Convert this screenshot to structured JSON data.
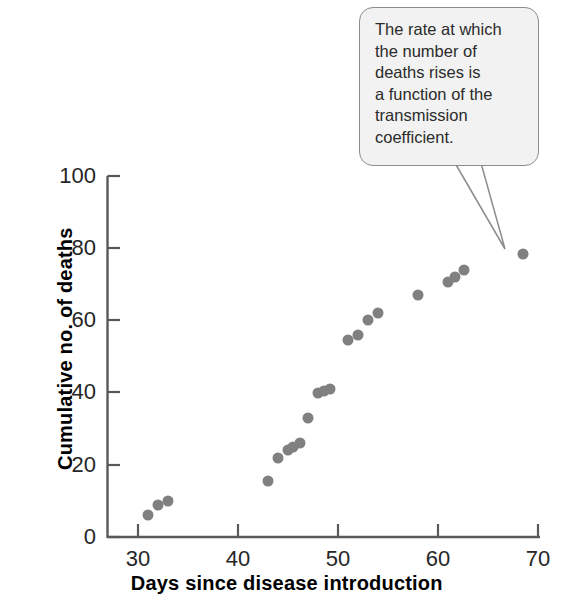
{
  "chart_data": {
    "type": "scatter",
    "title": "",
    "xlabel": "Days since disease introduction",
    "ylabel": "Cumulative no. of deaths",
    "xlim": [
      28,
      70
    ],
    "ylim": [
      0,
      100
    ],
    "xticks": [
      30,
      40,
      50,
      60,
      70
    ],
    "yticks": [
      0,
      20,
      40,
      60,
      80,
      100
    ],
    "grid": false,
    "legend": null,
    "marker_color": "#808080",
    "marker_size": 11,
    "x": [
      31,
      32,
      33,
      43,
      44,
      45,
      45.5,
      46.2,
      47,
      48,
      48.6,
      49.2,
      51,
      52,
      53,
      54,
      58,
      61,
      61.7,
      62.6,
      68.5
    ],
    "y": [
      6,
      9,
      10,
      15.5,
      22,
      24,
      25,
      26,
      33,
      40,
      40.5,
      41,
      54.5,
      56,
      60,
      62,
      67,
      70.5,
      72,
      74,
      78.5
    ],
    "series": [
      {
        "name": "Cumulative deaths",
        "points": [
          {
            "x": 31,
            "y": 6
          },
          {
            "x": 32,
            "y": 9
          },
          {
            "x": 33,
            "y": 10
          },
          {
            "x": 43,
            "y": 15.5
          },
          {
            "x": 44,
            "y": 22
          },
          {
            "x": 45,
            "y": 24
          },
          {
            "x": 45.5,
            "y": 25
          },
          {
            "x": 46.2,
            "y": 26
          },
          {
            "x": 47,
            "y": 33
          },
          {
            "x": 48,
            "y": 40
          },
          {
            "x": 48.6,
            "y": 40.5
          },
          {
            "x": 49.2,
            "y": 41
          },
          {
            "x": 51,
            "y": 54.5
          },
          {
            "x": 52,
            "y": 56
          },
          {
            "x": 53,
            "y": 60
          },
          {
            "x": 54,
            "y": 62
          },
          {
            "x": 58,
            "y": 67
          },
          {
            "x": 61,
            "y": 70.5
          },
          {
            "x": 61.7,
            "y": 72
          },
          {
            "x": 62.6,
            "y": 74
          },
          {
            "x": 68.5,
            "y": 78.5
          }
        ]
      }
    ],
    "annotations": [
      {
        "text": "The rate at which\nthe number of\ndeaths rises is\na function of the\ntransmission\ncoefficient.",
        "points_to": {
          "x": 68.5,
          "y": 78.5
        }
      }
    ]
  },
  "axes": {
    "y_tick_labels": [
      "100",
      "80",
      "60",
      "40",
      "20",
      "0"
    ],
    "x_tick_labels": [
      "30",
      "40",
      "50",
      "60",
      "70"
    ],
    "x_title": "Days since disease introduction",
    "y_title": "Cumulative no. of deaths"
  },
  "callout": {
    "text": "The rate at which\nthe number of\ndeaths rises is\na function of the\ntransmission\ncoefficient.",
    "fill_color": "#f2f2f2",
    "border_color": "#8c8c8c"
  },
  "colors": {
    "marker": "#808080",
    "axis": "#595959",
    "text": "#1a1a1a"
  }
}
